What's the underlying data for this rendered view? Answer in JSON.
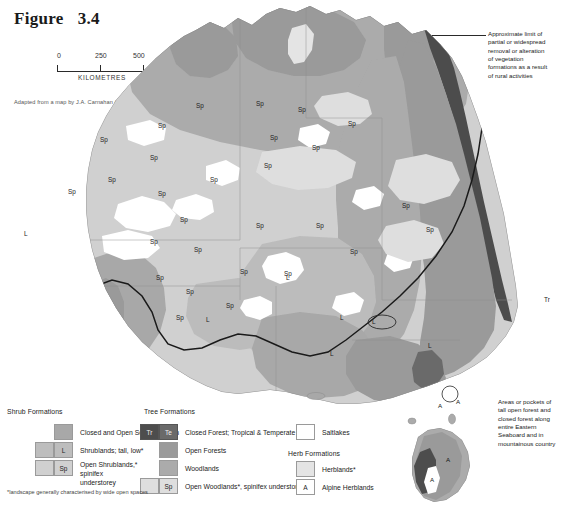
{
  "figure": {
    "label": "Figure",
    "number": "3.4"
  },
  "scale": {
    "ticks": [
      "0",
      "250",
      "500"
    ],
    "unit": "KILOMETRES"
  },
  "credit": "Adapted from a map by J.A. Carnahan (Atlas, 1977)",
  "annotations": {
    "rural_limit": "Approximate limit of partial or widespread removal or alteration of vegetation formations as a result of rural activities",
    "eastern_seaboard": "Areas or pockets of tall open forest and closed forest along entire Eastern Seaboard and in mountainous country"
  },
  "legend": {
    "shrub": {
      "heading": "Shrub Formations",
      "items": [
        {
          "symbol": "",
          "color": "#a8a8a8",
          "label": "Closed and Open Scrub & Heath"
        },
        {
          "symbol": "L",
          "color": "#bdbdbd",
          "label": "Shrublands; tall, low*"
        },
        {
          "symbol": "Sp",
          "color": "#d0d0d0",
          "label": "Open Shrublands,* spinifex understorey"
        }
      ]
    },
    "tree": {
      "heading": "Tree Formations",
      "items": [
        {
          "symbol": "Tr",
          "symbol2": "Te",
          "color": "#4d4d4d",
          "color2": "#6a6a6a",
          "label": "Closed Forest; Tropical & Temperate"
        },
        {
          "symbol": "",
          "color": "#9a9a9a",
          "label": "Open Forests"
        },
        {
          "symbol": "",
          "color": "#ababab",
          "label": "Woodlands"
        },
        {
          "symbol": "Sp",
          "color": "#dedede",
          "label": "Open Woodlands*, spinifex understorey"
        }
      ]
    },
    "other": {
      "saltlakes": {
        "symbol": "",
        "color": "#ffffff",
        "label": "Saltlakes"
      },
      "herb_heading": "Herb Formations",
      "items": [
        {
          "symbol": "",
          "color": "#e4e4e4",
          "label": "Herblands*"
        },
        {
          "symbol": "A",
          "color": "#ffffff",
          "label": "Alpine Herblands"
        }
      ]
    },
    "footnote": "*landscape generally characterised by wide open spaces"
  },
  "map": {
    "title": "Vegetation formations of Australia",
    "spinifex_label": "Sp",
    "shrubland_label": "L",
    "alpine_label": "A",
    "tropical_label": "Tr",
    "colors": {
      "closed_forest_tropical": "#4d4d4d",
      "closed_forest_temperate": "#6a6a6a",
      "open_forest": "#9a9a9a",
      "woodland": "#ababab",
      "open_woodland": "#dedede",
      "scrub_heath": "#a8a8a8",
      "shrubland": "#bdbdbd",
      "open_shrubland": "#d0d0d0",
      "herbland": "#e4e4e4",
      "saltlake": "#ffffff",
      "background": "#ffffff",
      "rural_limit_line": "#1a1a1a"
    }
  }
}
